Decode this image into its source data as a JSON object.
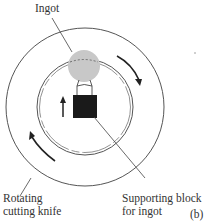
{
  "figure": {
    "panel_label": "(b)",
    "labels": {
      "ingot": "Ingot",
      "knife_line1": "Rotating",
      "knife_line2": "cutting knife",
      "block_line1": "Supporting block",
      "block_line2": "for ingot"
    },
    "colors": {
      "ingot_fill": "#c8c8c8",
      "block_fill": "#1a1a1a",
      "line": "#444444"
    }
  }
}
